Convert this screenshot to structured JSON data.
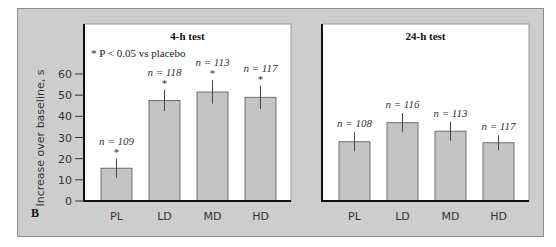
{
  "figure_label": "B",
  "y_axis_label": "Increase over baseline, s",
  "footnote": "* P < 0.05 vs placebo",
  "colors": {
    "frame_bg": "#cdcdcd",
    "panel_bg": "#ffffff",
    "bar_fill": "#c4c4c4",
    "bar_stroke": "#555555",
    "axis": "#111111"
  },
  "chart_data": [
    {
      "type": "bar",
      "title": "4-h test",
      "xlabel": "",
      "ylabel": "Increase over baseline, s",
      "ylim": [
        0,
        60
      ],
      "yticks": [
        0,
        10,
        20,
        30,
        40,
        50,
        60
      ],
      "grid": false,
      "categories": [
        "PL",
        "LD",
        "MD",
        "HD"
      ],
      "values": [
        15.5,
        47.5,
        51.5,
        49
      ],
      "error": [
        4.5,
        5,
        5.5,
        5.5
      ],
      "n_labels": [
        "n = 109",
        "n = 118",
        "n = 113",
        "n = 117"
      ],
      "significant": [
        true,
        true,
        true,
        true
      ],
      "annotation": "* P < 0.05 vs placebo"
    },
    {
      "type": "bar",
      "title": "24-h test",
      "xlabel": "",
      "ylabel": "Increase over baseline, s",
      "ylim": [
        0,
        60
      ],
      "grid": false,
      "categories": [
        "PL",
        "LD",
        "MD",
        "HD"
      ],
      "values": [
        28,
        37,
        33,
        27.5
      ],
      "error": [
        4.5,
        4.5,
        4.5,
        3.5
      ],
      "n_labels": [
        "n = 108",
        "n = 116",
        "n = 113",
        "n = 117"
      ],
      "significant": [
        false,
        false,
        false,
        false
      ]
    }
  ]
}
